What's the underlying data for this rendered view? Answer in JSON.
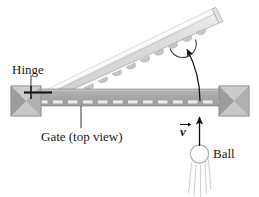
{
  "figure": {
    "background": "#ffffff",
    "width": 259,
    "height": 197
  },
  "labels": {
    "hinge": "Hinge",
    "gate": "Gate (top view)",
    "ball": "Ball",
    "velocity": "v"
  },
  "colors": {
    "gate_bar_fill": "#a9a9a9",
    "gate_bar_edge": "#8c8c8c",
    "gate_dash": "#e8e8e8",
    "swung_gate_fill": "#d6d6d6",
    "swung_gate_highlight": "#f4f4f4",
    "swung_gate_edge": "#9a9a9a",
    "post_light": "#c9c9c9",
    "post_mid": "#a5a5a5",
    "post_dark": "#8e8e8e",
    "ball_outline": "#b5b5b5",
    "ball_fill": "#fdfdfd",
    "trail": "#cfcfcf",
    "ink": "#1a1a1a",
    "leader": "#333333"
  },
  "elements": {
    "swung_gate": {
      "name": "swung-gate-beam",
      "description": "Light gray gate swung open, tilted upward to the right with scalloped notches on its lower edge"
    },
    "gate_bar": {
      "name": "gate-bar-closed",
      "description": "Horizontal medium gray bar representing the gate in top view with light dashes"
    },
    "left_post": {
      "name": "hinge-post",
      "description": "Square pyramid-shaded post at the left end supporting the hinge"
    },
    "right_post": {
      "name": "latch-post",
      "description": "Square pyramid-shaded post at the right end"
    },
    "ball": {
      "name": "ball-circle",
      "description": "Outlined circle with motion trail lines beneath it"
    },
    "velocity_arrow": {
      "name": "velocity-arrow",
      "description": "Vertical arrow pointing up from the ball toward the gate"
    },
    "swing_arrow": {
      "name": "swing-trajectory-arrow",
      "description": "Curved arrow from the gate bar up to the swung gate indicating rotation"
    },
    "angle_arc": {
      "name": "swing-angle-arc",
      "description": "Small arc beneath the swung gate at the arrow tip"
    },
    "hinge_leader": {
      "name": "hinge-leader-line",
      "description": "Short vertical leader from the Hinge label down to the hinge point"
    },
    "gate_leader": {
      "name": "gate-leader-line",
      "description": "Vertical leader from the Gate (top view) label up to the gate bar"
    }
  }
}
